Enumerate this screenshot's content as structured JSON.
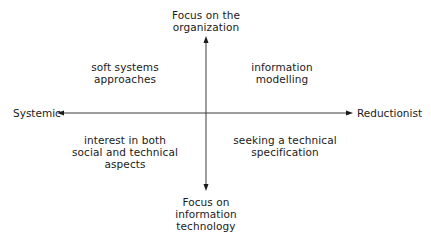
{
  "diagram": {
    "axes": {
      "top": "Focus on the\norganization",
      "bottom": "Focus on\ninformation\ntechnology",
      "left": "Systemic",
      "right": "Reductionist"
    },
    "quadrants": {
      "top_left": "soft systems\napproaches",
      "top_right": "information\nmodelling",
      "bottom_left": "interest in both\nsocial and technical\naspects",
      "bottom_right": "seeking a technical\nspecification"
    },
    "colors": {
      "line": "#3a3a3a",
      "text": "#1a1a1a",
      "background": "#ffffff"
    }
  }
}
